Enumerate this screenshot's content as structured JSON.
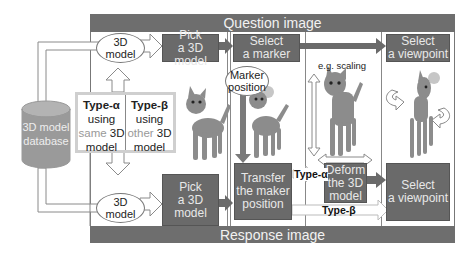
{
  "diagram": {
    "question_bar": {
      "label": "Question image"
    },
    "response_bar": {
      "label": "Response image"
    },
    "database": {
      "line1": "3D model",
      "line2": "database"
    },
    "top_ellipse": {
      "line1": "3D",
      "line2": "model"
    },
    "bottom_ellipse": {
      "line1": "3D",
      "line2": "model"
    },
    "type_box": {
      "alpha": {
        "head": "Type-α",
        "line1": "using",
        "muted": "same",
        "strong": "3D",
        "line3": "model"
      },
      "beta": {
        "head": "Type-β",
        "line1": "using",
        "muted": "other",
        "strong": "3D",
        "line3": "model"
      }
    },
    "question_steps": [
      {
        "line1": "Pick",
        "line2": "a 3D model"
      },
      {
        "line1": "Select",
        "line2": "a marker"
      },
      {
        "line1": "Select",
        "line2": "a viewpoint"
      }
    ],
    "response_steps": [
      {
        "line1": "Pick",
        "line2": "a 3D model"
      },
      {
        "line1": "Transfer",
        "line2": "the maker",
        "line3": "position"
      },
      {
        "line1": "Deform",
        "line2": "the 3D",
        "line3": "model"
      },
      {
        "line1": "Select",
        "line2": "a viewpoint"
      }
    ],
    "marker_ellipse": {
      "line1": "Marker",
      "line2": "position"
    },
    "scaling_note": "e.g. scaling",
    "type_alpha_tag": "Type-α",
    "type_beta_tag": "Type-β",
    "colors": {
      "bar": "#6e6e6e",
      "box": "#6a6a6a",
      "arrow_fill": "#ffffff",
      "arrow_stroke": "#8a8a8a",
      "database": "#9a9a9a",
      "cat": "#8c8c8c"
    }
  }
}
